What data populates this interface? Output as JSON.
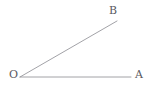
{
  "figure": {
    "kind": "geometry-angle-diagram",
    "width": 153,
    "height": 90,
    "background_color": "#ffffff",
    "stroke_color": "#8a8a90",
    "label_color": "#59595e",
    "stroke_width": 0.8
  },
  "labels": {
    "vertex": "O",
    "ray_a_end": "A",
    "ray_b_end": "B"
  },
  "chart_data": {
    "type": "scatter",
    "title": "",
    "xlabel": "",
    "ylabel": "",
    "points": [
      {
        "label": "O",
        "x": 20,
        "y": 77,
        "role": "vertex"
      },
      {
        "label": "A",
        "x": 131,
        "y": 77,
        "role": "ray-endpoint"
      },
      {
        "label": "B",
        "x": 117,
        "y": 21,
        "role": "ray-endpoint"
      }
    ],
    "segments": [
      {
        "name": "ray-OA",
        "from": "O",
        "to": "A",
        "x1": 20,
        "y1": 77,
        "x2": 131,
        "y2": 77
      },
      {
        "name": "ray-OB",
        "from": "O",
        "to": "B",
        "x1": 20,
        "y1": 77,
        "x2": 117,
        "y2": 21
      }
    ],
    "angle_degrees": 30,
    "grid": false,
    "legend": "none"
  }
}
